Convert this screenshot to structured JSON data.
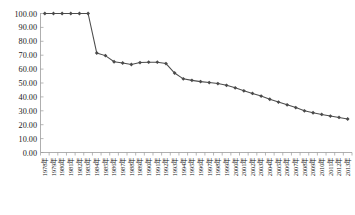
{
  "chart_data": {
    "type": "line",
    "title": "",
    "subtitle": "",
    "xlabel": "",
    "ylabel": "",
    "ylim": [
      0,
      100
    ],
    "yticks": [
      "0.00",
      "10.00",
      "20.00",
      "30.00",
      "40.00",
      "50.00",
      "60.00",
      "70.00",
      "80.00",
      "90.00",
      "100.00"
    ],
    "ytick_values": [
      0,
      10,
      20,
      30,
      40,
      50,
      60,
      70,
      80,
      90,
      100
    ],
    "grid": false,
    "legend_position": "bottom",
    "marker": "diamond",
    "categories": [
      "1978年",
      "1979年",
      "1980年",
      "1981年",
      "1982年",
      "1983年",
      "1984年",
      "1985年",
      "1986年",
      "1987年",
      "1988年",
      "1989年",
      "1990年",
      "1991年",
      "1992年",
      "1993年",
      "1994年",
      "1995年",
      "1996年",
      "1997年",
      "1998年",
      "1999年",
      "2000年",
      "2001年",
      "2002年",
      "2003年",
      "2004年",
      "2005年",
      "2006年",
      "2007年",
      "2008年",
      "2009年",
      "2010年",
      "2011年",
      "2012年",
      "2013年"
    ],
    "series": [
      {
        "name": "",
        "values": [
          100.0,
          100.0,
          100.0,
          100.0,
          100.0,
          100.0,
          71.6,
          69.7,
          65.3,
          64.4,
          63.3,
          64.7,
          65.0,
          65.0,
          64.0,
          57.2,
          53.0,
          51.9,
          51.0,
          50.3,
          49.6,
          48.3,
          46.5,
          44.4,
          42.5,
          40.6,
          38.3,
          36.3,
          34.3,
          32.3,
          30.0,
          28.6,
          27.4,
          26.2,
          25.2,
          24.1
        ]
      }
    ]
  },
  "caption": {
    "text": ""
  }
}
